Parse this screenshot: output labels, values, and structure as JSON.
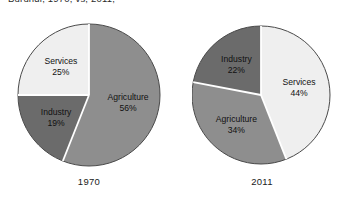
{
  "caption": {
    "clipped_text": "Burundi, 1970, vs, 2011,"
  },
  "chart_data": [
    {
      "type": "pie",
      "title": "1970",
      "categories": [
        "Agriculture",
        "Industry",
        "Services"
      ],
      "values": [
        56,
        19,
        25
      ],
      "unit": "%",
      "start_angle_deg": 0,
      "direction": "clockwise",
      "legend": "none",
      "labels": [
        {
          "name": "Agriculture",
          "percent": "56%",
          "color": "#8e8e8e"
        },
        {
          "name": "Industry",
          "percent": "19%",
          "color": "#6b6b6b"
        },
        {
          "name": "Services",
          "percent": "25%",
          "color": "#efefef"
        }
      ]
    },
    {
      "type": "pie",
      "title": "2011",
      "categories": [
        "Services",
        "Agriculture",
        "Industry"
      ],
      "values": [
        44,
        34,
        22
      ],
      "unit": "%",
      "start_angle_deg": 0,
      "direction": "clockwise",
      "legend": "none",
      "labels": [
        {
          "name": "Services",
          "percent": "44%",
          "color": "#efefef"
        },
        {
          "name": "Agriculture",
          "percent": "34%",
          "color": "#8e8e8e"
        },
        {
          "name": "Industry",
          "percent": "22%",
          "color": "#6b6b6b"
        }
      ]
    }
  ],
  "colors": {
    "agriculture": "#8e8e8e",
    "industry": "#6b6b6b",
    "services": "#efefef",
    "outline": "#4a4a4a",
    "separator": "#ffffff",
    "background": "#ffffff",
    "text": "#111111"
  },
  "charts": {
    "left": {
      "year": "1970"
    },
    "right": {
      "year": "2011"
    }
  }
}
